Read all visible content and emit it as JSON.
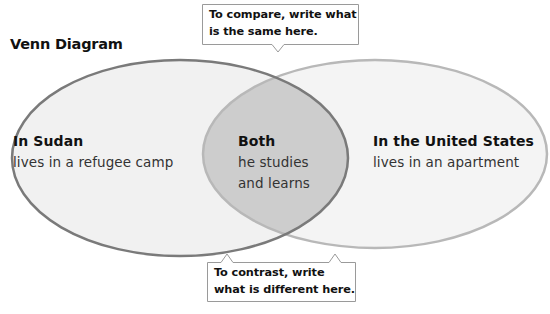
{
  "title": "Venn Diagram",
  "callouts": {
    "compare": {
      "line1": "To compare, write what",
      "line2": "is the same here."
    },
    "contrast": {
      "line1": "To contrast, write",
      "line2": "what is different here."
    }
  },
  "sets": {
    "left": {
      "heading": "In Sudan",
      "items": [
        "lives in a refugee camp"
      ]
    },
    "overlap": {
      "heading": "Both",
      "items": [
        "he studies",
        "and learns"
      ]
    },
    "right": {
      "heading": "In the United States",
      "items": [
        "lives in an apartment"
      ]
    }
  },
  "colors": {
    "left_fill": "#f2f2f2",
    "right_fill": "#f4f4f4",
    "overlap_fill": "#cfcfcf",
    "left_stroke": "#7a7a7a",
    "right_stroke": "#b5b5b5",
    "callout_border": "#9a9a9a"
  }
}
